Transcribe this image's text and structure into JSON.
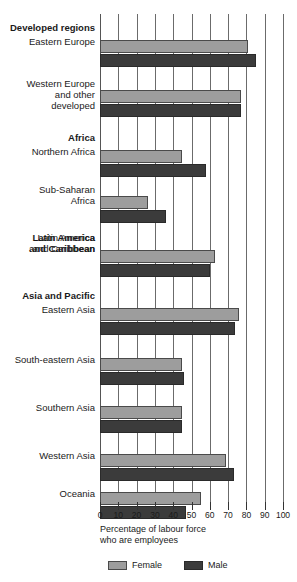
{
  "chart_data": {
    "type": "bar",
    "orientation": "horizontal",
    "title": "",
    "xlabel": "Percentage of labour force\nwho are employees",
    "ylabel": "",
    "xlim": [
      0,
      100
    ],
    "xticks": [
      0,
      10,
      20,
      30,
      40,
      50,
      60,
      70,
      80,
      90,
      100
    ],
    "xtick_labels": [
      "0",
      "10",
      "20",
      "30",
      "40",
      "50",
      "60",
      "70",
      "80",
      "90",
      "100"
    ],
    "grid": true,
    "legend_position": "bottom-left",
    "legend": [
      "Female",
      "Male"
    ],
    "group_headers": [
      "Developed regions",
      "Africa",
      "Latin America\nand Caribbean",
      "Asia and Pacific"
    ],
    "categories": [
      "Eastern Europe",
      "Western Europe\nand other\ndeveloped",
      "Northern Africa",
      "Sub-Saharan\nAfrica",
      "Latin America\nand Caribbean",
      "Eastern Asia",
      "South-eastern Asia",
      "Southern Asia",
      "Western Asia",
      "Oceania"
    ],
    "series": [
      {
        "name": "Female",
        "color": "#9d9d9d",
        "values": [
          81,
          77,
          45,
          26,
          63,
          76,
          45,
          45,
          69,
          55
        ]
      },
      {
        "name": "Male",
        "color": "#3b3b3b",
        "values": [
          85,
          77,
          58,
          36,
          60,
          74,
          46,
          45,
          73,
          47
        ]
      }
    ]
  },
  "colors": {
    "female": "#9d9d9d",
    "male": "#3b3b3b",
    "gridline": "#6b6b6b",
    "text": "#1a1a1a",
    "background": "#ffffff"
  }
}
